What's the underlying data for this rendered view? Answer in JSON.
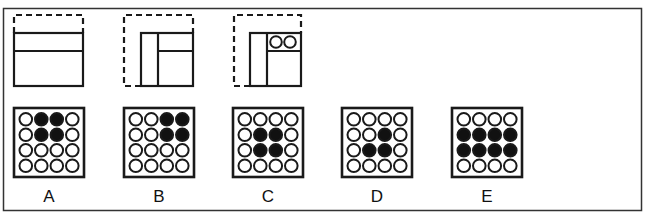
{
  "colors": {
    "stroke": "#1a1a1a",
    "fill": "#111111",
    "bg": "#ffffff",
    "frame": "#333333"
  },
  "figures": [
    {
      "id": "fig1",
      "type": "strip-horizontal"
    },
    {
      "id": "fig2",
      "type": "strip-vertical-then-horizontal"
    },
    {
      "id": "fig3",
      "type": "strip-with-two-circles"
    }
  ],
  "options": [
    {
      "label": "A",
      "grid": [
        [
          0,
          1,
          1,
          0
        ],
        [
          0,
          1,
          1,
          0
        ],
        [
          0,
          0,
          0,
          0
        ],
        [
          0,
          0,
          0,
          0
        ]
      ]
    },
    {
      "label": "B",
      "grid": [
        [
          0,
          0,
          1,
          1
        ],
        [
          0,
          0,
          1,
          1
        ],
        [
          0,
          0,
          0,
          0
        ],
        [
          0,
          0,
          0,
          0
        ]
      ]
    },
    {
      "label": "C",
      "grid": [
        [
          0,
          0,
          0,
          0
        ],
        [
          0,
          1,
          1,
          0
        ],
        [
          0,
          1,
          1,
          0
        ],
        [
          0,
          0,
          0,
          0
        ]
      ]
    },
    {
      "label": "D",
      "grid": [
        [
          0,
          0,
          0,
          0
        ],
        [
          0,
          0,
          1,
          0
        ],
        [
          0,
          1,
          1,
          0
        ],
        [
          0,
          0,
          0,
          0
        ]
      ]
    },
    {
      "label": "E",
      "grid": [
        [
          0,
          0,
          0,
          0
        ],
        [
          1,
          1,
          1,
          1
        ],
        [
          1,
          1,
          1,
          1
        ],
        [
          0,
          0,
          0,
          0
        ]
      ]
    }
  ]
}
